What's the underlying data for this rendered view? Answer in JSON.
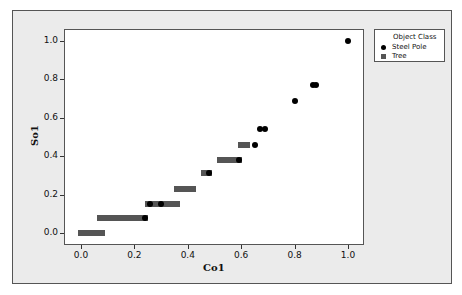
{
  "chart_data": {
    "type": "scatter",
    "title": "",
    "xlabel": "Co1",
    "ylabel": "So1",
    "xlim": [
      -0.06,
      1.06
    ],
    "ylim": [
      -0.05,
      1.06
    ],
    "x_ticks": [
      "0.0",
      "0.2",
      "0.4",
      "0.6",
      "0.8",
      "1.0"
    ],
    "y_ticks": [
      "0.0",
      "0.2",
      "0.4",
      "0.6",
      "0.8",
      "1.0"
    ],
    "grid": false,
    "legend": {
      "title": "Object Class",
      "position": "right-top",
      "entries": [
        "Steel Pole",
        "Tree"
      ]
    },
    "series": [
      {
        "name": "Tree",
        "marker": "square",
        "color": "#555555",
        "segments": [
          {
            "y": 0.0,
            "x_start": 0.0,
            "x_end": 0.08
          },
          {
            "y": 0.08,
            "x_start": 0.07,
            "x_end": 0.24
          },
          {
            "y": 0.15,
            "x_start": 0.25,
            "x_end": 0.36
          },
          {
            "y": 0.23,
            "x_start": 0.36,
            "x_end": 0.42
          },
          {
            "y": 0.31,
            "x_start": 0.46,
            "x_end": 0.48
          },
          {
            "y": 0.38,
            "x_start": 0.52,
            "x_end": 0.59
          },
          {
            "y": 0.46,
            "x_start": 0.6,
            "x_end": 0.62
          }
        ]
      },
      {
        "name": "Steel Pole",
        "marker": "circle",
        "color": "#000000",
        "points": [
          {
            "x": 0.24,
            "y": 0.08
          },
          {
            "x": 0.26,
            "y": 0.15
          },
          {
            "x": 0.3,
            "y": 0.15
          },
          {
            "x": 0.48,
            "y": 0.31
          },
          {
            "x": 0.59,
            "y": 0.38
          },
          {
            "x": 0.65,
            "y": 0.46
          },
          {
            "x": 0.67,
            "y": 0.54
          },
          {
            "x": 0.69,
            "y": 0.54
          },
          {
            "x": 0.8,
            "y": 0.69
          },
          {
            "x": 0.87,
            "y": 0.77
          },
          {
            "x": 0.88,
            "y": 0.77
          },
          {
            "x": 1.0,
            "y": 1.0
          }
        ]
      }
    ]
  },
  "axes": {
    "x_title": "Co1",
    "y_title": "So1",
    "x_ticks": [
      "0.0",
      "0.2",
      "0.4",
      "0.6",
      "0.8",
      "1.0"
    ],
    "y_ticks": [
      "0.0",
      "0.2",
      "0.4",
      "0.6",
      "0.8",
      "1.0"
    ]
  },
  "legend": {
    "title": "Object Class",
    "items": [
      {
        "label": "Steel Pole",
        "symbol": "circle-icon"
      },
      {
        "label": "Tree",
        "symbol": "square-icon"
      }
    ]
  }
}
